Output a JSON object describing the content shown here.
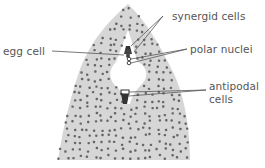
{
  "diagram": {
    "labels": {
      "synergid": "synergid cells",
      "egg": "egg cell",
      "polar": "polar nuclei",
      "antipodal_1": "antipodal",
      "antipodal_2": "cells"
    },
    "colors": {
      "tissue": "#d4d4d4",
      "dots": "#666666",
      "lines": "#555555",
      "text": "#555555"
    }
  }
}
